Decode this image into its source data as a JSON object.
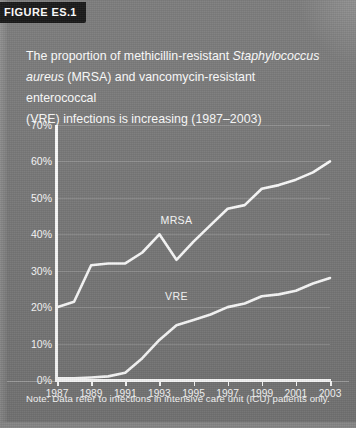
{
  "figure": {
    "tab_label": "FIGURE ES.1",
    "title_line1_a": "The proportion of methicillin-resistant ",
    "title_line1_italic": "Staphylococcus",
    "title_line2_italic": "aureus",
    "title_line2_b": " (MRSA) and vancomycin-resistant enterococcal",
    "title_line3": "(VRE) infections is increasing (1987–2003)",
    "note": "Note: Data refer to infections in intensive care unit (ICU) patients only.",
    "panel_color": "#767676",
    "ink_color": "#ffffff",
    "tab_color": "#0d0d0d"
  },
  "chart_data": {
    "type": "line",
    "title": "The proportion of methicillin-resistant Staphylococcus aureus (MRSA) and vancomycin-resistant enterococcal (VRE) infections is increasing (1987–2003)",
    "subtitle": "",
    "xlabel": "",
    "ylabel": "",
    "xlim": [
      1987,
      2003
    ],
    "ylim": [
      0,
      70
    ],
    "grid": true,
    "grid_axis": "y",
    "legend": "inline-labels",
    "y_tick_labels": [
      "0%",
      "10%",
      "20%",
      "30%",
      "40%",
      "50%",
      "60%",
      "70%"
    ],
    "y_ticks": [
      0,
      10,
      20,
      30,
      40,
      50,
      60,
      70
    ],
    "x_tick_labels": [
      "1987",
      "1989",
      "1991",
      "1993",
      "1995",
      "1997",
      "1999",
      "2001",
      "2003"
    ],
    "x_ticks": [
      1987,
      1989,
      1991,
      1993,
      1995,
      1997,
      1999,
      2001,
      2003
    ],
    "x": [
      1987,
      1988,
      1989,
      1990,
      1991,
      1992,
      1993,
      1994,
      1995,
      1996,
      1997,
      1998,
      1999,
      2000,
      2001,
      2002,
      2003
    ],
    "series": [
      {
        "name": "MRSA",
        "label_x": 1994,
        "label_y": 44,
        "values": [
          20,
          21.5,
          31.5,
          32,
          32,
          35,
          40,
          33,
          38,
          42.5,
          47,
          48,
          52.5,
          53.5,
          55,
          57,
          60
        ]
      },
      {
        "name": "VRE",
        "label_x": 1994,
        "label_y": 23,
        "values": [
          0.5,
          0.5,
          0.7,
          1,
          2,
          6,
          11,
          15,
          16.5,
          18,
          20,
          21,
          23,
          23.5,
          24.5,
          26.5,
          28
        ]
      }
    ],
    "units": "percent"
  }
}
